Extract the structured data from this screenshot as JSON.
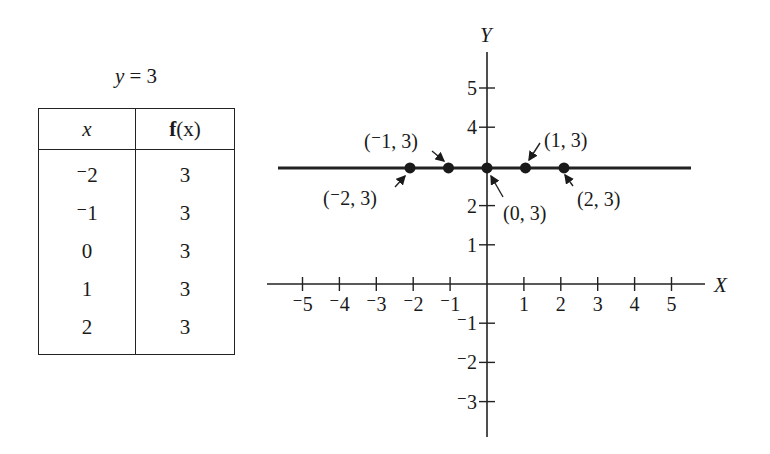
{
  "table": {
    "title_lhs": "y",
    "title_rhs": "= 3",
    "headers": {
      "x": "x",
      "fx_bold": "f",
      "fx_rest": "(x)"
    },
    "rows": [
      {
        "x": "⁻2",
        "fx": "3"
      },
      {
        "x": "⁻1",
        "fx": "3"
      },
      {
        "x": "0",
        "fx": "3"
      },
      {
        "x": "1",
        "fx": "3"
      },
      {
        "x": "2",
        "fx": "3"
      }
    ]
  },
  "chart_data": {
    "type": "line",
    "title": "y = 3",
    "xlabel": "X",
    "ylabel": "Y",
    "xlim": [
      -5.5,
      5.5
    ],
    "ylim": [
      -4,
      6
    ],
    "x_ticks": [
      "-5",
      "-4",
      "-3",
      "-2",
      "-1",
      "1",
      "2",
      "3",
      "4",
      "5"
    ],
    "y_ticks": [
      "5",
      "4",
      "2",
      "1",
      "-1",
      "-2",
      "-3"
    ],
    "grid": false,
    "series": [
      {
        "name": "y = 3",
        "x": [
          -2,
          -1,
          0,
          1,
          2
        ],
        "y": [
          3,
          3,
          3,
          3,
          3
        ]
      }
    ],
    "annotations": [
      "(⁻2, 3)",
      "(⁻1, 3)",
      "(0, 3)",
      "(1, 3)",
      "(2, 3)"
    ]
  }
}
